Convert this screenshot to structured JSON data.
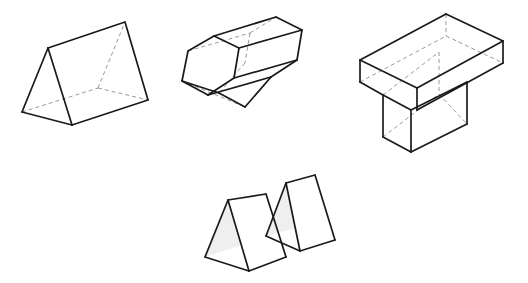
{
  "canvas": {
    "width": 528,
    "height": 283,
    "background_color": "#ffffff",
    "title": "Geometric Solids Diagram"
  },
  "style": {
    "visible_edge_color": "#1a1a1a",
    "visible_edge_width": 1.7,
    "hidden_edge_color": "#9a9a9a",
    "hidden_edge_width": 1.0,
    "hidden_edge_dash": "4,3",
    "face_fill_color": "#ffffff",
    "shaded_face_fill_color": "#efefef"
  },
  "figures": [
    {
      "id": "triangular-prism-large",
      "label": "Triangular prism",
      "position": "top-left",
      "faces": [
        {
          "name": "top-slanted-face",
          "fill": "#ffffff",
          "points": "48,48 125,22 148,100 72,125"
        },
        {
          "name": "near-triangular-end",
          "fill": "#ffffff",
          "points": "48,48 72,125 22,112"
        }
      ],
      "visible_edges": [
        {
          "name": "apex-ridge",
          "points": "48,48 125,22"
        },
        {
          "name": "far-right-slant",
          "points": "125,22 148,100"
        },
        {
          "name": "right-bottom-edge",
          "points": "148,100 72,125"
        },
        {
          "name": "near-apex-to-bottom-front",
          "points": "48,48 72,125"
        },
        {
          "name": "near-apex-to-bottom-left",
          "points": "48,48 22,112"
        },
        {
          "name": "near-bottom-edge",
          "points": "22,112 72,125"
        }
      ],
      "hidden_edges": [
        {
          "name": "hidden-base-left-to-back",
          "points": "22,112 98,88"
        },
        {
          "name": "hidden-base-back-to-right",
          "points": "98,88 148,100"
        },
        {
          "name": "hidden-vertical-to-far-apex",
          "points": "98,88 125,22"
        }
      ]
    },
    {
      "id": "hexagonal-prism",
      "label": "Hexagonal prism",
      "position": "top-middle",
      "faces": [
        {
          "name": "near-hex-face",
          "fill": "#ffffff",
          "points": "188,51 214,36 239,48 234,78 208,95 182,81"
        },
        {
          "name": "upper-long-face",
          "fill": "#ffffff",
          "points": "214,36 276,17 302,30 239,48"
        },
        {
          "name": "upper-right-long-face",
          "fill": "#ffffff",
          "points": "239,48 302,30 297,60 234,78"
        },
        {
          "name": "lower-long-face",
          "fill": "#ffffff",
          "points": "234,78 297,60 271,77 208,95"
        },
        {
          "name": "lower-left-long-face",
          "fill": "#ffffff",
          "points": "208,95 271,77 245,107 182,81"
        }
      ],
      "visible_edges": [
        {
          "name": "hex-near-edge-1",
          "points": "188,51 214,36"
        },
        {
          "name": "hex-near-edge-2",
          "points": "214,36 239,48"
        },
        {
          "name": "hex-near-edge-3",
          "points": "239,48 234,78"
        },
        {
          "name": "hex-near-edge-4",
          "points": "234,78 208,95"
        },
        {
          "name": "hex-near-edge-5",
          "points": "208,95 182,81"
        },
        {
          "name": "hex-near-edge-6",
          "points": "182,81 188,51"
        },
        {
          "name": "long-edge-top",
          "points": "214,36 276,17"
        },
        {
          "name": "long-edge-upper-right",
          "points": "239,48 302,30"
        },
        {
          "name": "long-edge-lower-right",
          "points": "234,78 297,60"
        },
        {
          "name": "long-edge-bottom",
          "points": "208,95 271,77"
        },
        {
          "name": "hex-far-edge-1",
          "points": "276,17 302,30"
        },
        {
          "name": "hex-far-edge-2",
          "points": "302,30 297,60"
        },
        {
          "name": "hex-far-edge-3",
          "points": "297,60 271,77"
        },
        {
          "name": "hex-far-edge-4",
          "points": "271,77 245,107"
        },
        {
          "name": "hex-far-edge-5",
          "points": "245,107 219,93"
        },
        {
          "name": "hex-far-edge-6-partial",
          "points": "219,93 182,81"
        }
      ],
      "hidden_edges": [
        {
          "name": "hidden-long-edge-left",
          "points": "188,51 250,33"
        },
        {
          "name": "hidden-long-edge-lower-left",
          "points": "182,81 245,107"
        },
        {
          "name": "hidden-hex-far-edge-a",
          "points": "250,33 276,17"
        },
        {
          "name": "hidden-hex-far-edge-b",
          "points": "250,33 245,63"
        },
        {
          "name": "hidden-hex-far-edge-c",
          "points": "245,63 219,93"
        },
        {
          "name": "hidden-long-edge-mid",
          "points": "182,81 219,93"
        }
      ]
    },
    {
      "id": "t-shaped-prism",
      "label": "T-shaped prism",
      "position": "top-right",
      "faces": [
        {
          "name": "slab-top-face",
          "fill": "#ffffff",
          "points": "360,60 446,14 503,41 417,88"
        },
        {
          "name": "slab-front-face",
          "fill": "#ffffff",
          "points": "360,60 417,88 417,110 360,82"
        },
        {
          "name": "slab-right-face",
          "fill": "#ffffff",
          "points": "417,88 503,41 503,63 417,110"
        },
        {
          "name": "stem-front-face",
          "fill": "#ffffff",
          "points": "383,95 411,110 411,152 383,137"
        },
        {
          "name": "stem-right-face",
          "fill": "#ffffff",
          "points": "411,110 467,82 467,124 411,152"
        }
      ],
      "visible_edges": [
        {
          "name": "slab-top-back-left",
          "points": "360,60 446,14"
        },
        {
          "name": "slab-top-back-right",
          "points": "446,14 503,41"
        },
        {
          "name": "slab-top-front-right",
          "points": "503,41 417,88"
        },
        {
          "name": "slab-top-front-left",
          "points": "417,88 360,60"
        },
        {
          "name": "slab-left-vertical",
          "points": "360,60 360,82"
        },
        {
          "name": "slab-front-vertical",
          "points": "417,88 417,110"
        },
        {
          "name": "slab-right-vertical",
          "points": "503,41 503,63"
        },
        {
          "name": "slab-bottom-front-left",
          "points": "360,82 383,95"
        },
        {
          "name": "slab-bottom-front-right",
          "points": "417,110 503,63"
        },
        {
          "name": "stem-notch-top-left",
          "points": "383,95 411,110"
        },
        {
          "name": "stem-left-vertical",
          "points": "383,95 383,137"
        },
        {
          "name": "stem-mid-vertical",
          "points": "411,110 411,152"
        },
        {
          "name": "stem-bottom-front",
          "points": "383,137 411,152"
        },
        {
          "name": "stem-bottom-right",
          "points": "411,152 467,124"
        },
        {
          "name": "stem-right-vertical",
          "points": "467,82 467,124"
        },
        {
          "name": "stem-top-right-edge",
          "points": "411,110 467,82"
        }
      ],
      "hidden_edges": [
        {
          "name": "hidden-slab-back-vertical",
          "points": "446,14 446,36"
        },
        {
          "name": "hidden-slab-back-left-bottom",
          "points": "360,82 446,36"
        },
        {
          "name": "hidden-slab-back-right-bottom",
          "points": "446,36 503,63"
        },
        {
          "name": "hidden-stem-back-vertical",
          "points": "439,52 439,94"
        },
        {
          "name": "hidden-stem-back-top",
          "points": "383,95 439,52"
        },
        {
          "name": "hidden-stem-back-bottom",
          "points": "383,137 439,94"
        },
        {
          "name": "hidden-stem-back-bottom-right",
          "points": "439,94 467,124"
        }
      ]
    },
    {
      "id": "twin-triangular-prisms",
      "label": "Pair of triangular prisms",
      "position": "bottom-center",
      "faces": [
        {
          "name": "left-prism-slanted-face",
          "fill": "#ffffff",
          "points": "228,200 266,194 286,257 249,271"
        },
        {
          "name": "left-prism-near-end-shaded",
          "fill": "#efefef",
          "points": "228,200 249,271 205,257"
        },
        {
          "name": "left-prism-bottom-face",
          "fill": "#ffffff",
          "points": "205,257 249,271 286,257 242,245"
        },
        {
          "name": "right-prism-slanted-face",
          "fill": "#ffffff",
          "points": "286,183 315,175 335,240 300,251"
        },
        {
          "name": "right-prism-near-end-shaded",
          "fill": "#efefef",
          "points": "286,183 300,251 266,236"
        },
        {
          "name": "right-prism-bottom-face",
          "fill": "#ffffff",
          "points": "266,236 300,251 335,240 300,227"
        }
      ],
      "visible_edges": [
        {
          "name": "left-prism-ridge",
          "points": "228,200 266,194"
        },
        {
          "name": "left-prism-far-slant-right",
          "points": "266,194 286,257"
        },
        {
          "name": "left-prism-bottom-right",
          "points": "286,257 249,271"
        },
        {
          "name": "left-prism-near-slant-right",
          "points": "228,200 249,271"
        },
        {
          "name": "left-prism-near-slant-left",
          "points": "228,200 205,257"
        },
        {
          "name": "left-prism-bottom-left",
          "points": "205,257 249,271"
        },
        {
          "name": "right-prism-ridge",
          "points": "286,183 315,175"
        },
        {
          "name": "right-prism-far-slant-right",
          "points": "315,175 335,240"
        },
        {
          "name": "right-prism-bottom-right",
          "points": "335,240 300,251"
        },
        {
          "name": "right-prism-near-slant-right",
          "points": "286,183 300,251"
        },
        {
          "name": "right-prism-near-slant-left",
          "points": "286,183 266,236"
        },
        {
          "name": "right-prism-bottom-left",
          "points": "266,236 300,251"
        }
      ],
      "hidden_edges": []
    }
  ]
}
